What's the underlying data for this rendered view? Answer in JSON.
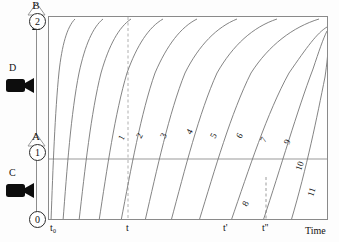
{
  "figure": {
    "type": "diagram"
  },
  "state_axis": {
    "name": "vertical-state-axis",
    "nodes": [
      {
        "id": "node-0",
        "label": "0",
        "y_frac": 0.98
      },
      {
        "id": "node-1",
        "label": "1",
        "y_frac": 0.66
      },
      {
        "id": "node-2",
        "label": "2",
        "y_frac": 0.035
      }
    ],
    "transitions": [
      {
        "id": "transition-A",
        "label": "A",
        "y_frac": 0.6
      },
      {
        "id": "transition-B",
        "label": "B",
        "y_frac": 0.0
      }
    ],
    "cameras": [
      {
        "id": "camera-C",
        "label": "C",
        "y_frac": 0.79
      },
      {
        "id": "camera-D",
        "label": "D",
        "y_frac": 0.36
      }
    ]
  },
  "plot": {
    "x_axis_title": "Time",
    "x_ticks": [
      {
        "label": "t₀",
        "x": 4
      },
      {
        "label": "t",
        "x": 80
      },
      {
        "label": "t'",
        "x": 178
      },
      {
        "label": "t''",
        "x": 218
      }
    ],
    "guides": {
      "horizontal_level_label": "1",
      "dashed_verticals": [
        {
          "at": "t",
          "x": 80,
          "full_height": true
        },
        {
          "at": "t''",
          "x": 219,
          "full_height": false
        }
      ]
    },
    "curve_labels": [
      "1",
      "2",
      "3",
      "4",
      "5",
      "6",
      "7",
      "8",
      "9",
      "10",
      "11"
    ]
  },
  "chart_data": {
    "type": "line",
    "title": "",
    "xlabel": "Time",
    "ylabel": "",
    "xlim": [
      0,
      280
    ],
    "ylim": [
      0,
      204
    ],
    "grid": false,
    "legend": "none",
    "annotations": [
      {
        "text": "t₀",
        "x": 4,
        "y": 204
      },
      {
        "text": "t",
        "x": 80,
        "y": 204
      },
      {
        "text": "t'",
        "x": 178,
        "y": 204
      },
      {
        "text": "t''",
        "x": 218,
        "y": 204
      },
      {
        "text": "Time",
        "x": 262,
        "y": 204
      }
    ],
    "series": [
      {
        "name": "1",
        "path": "M 2,204 C 4,150 6,95 10,55 C 13,28 18,10 26,2"
      },
      {
        "name": "2",
        "path": "M 14,204 C 18,152 22,96 30,56 C 36,28 44,10 54,2"
      },
      {
        "name": "3",
        "path": "M 30,204 C 36,152 42,96 52,56 C 60,28 70,10 82,2"
      },
      {
        "name": "4",
        "path": "M 50,204 C 58,152 66,96 78,56 C 88,28 100,10 114,2"
      },
      {
        "name": "5",
        "path": "M 72,204 C 82,152 92,96 106,56 C 118,28 132,10 148,2"
      },
      {
        "name": "6",
        "path": "M 96,204 C 108,152 120,96 136,56 C 150,28 168,10 188,2"
      },
      {
        "name": "7",
        "path": "M 122,204 C 136,152 150,96 168,56 C 184,28 204,10 228,2"
      },
      {
        "name": "8",
        "path": "M 150,204 C 166,152 182,96 202,56 C 220,28 244,10 270,2"
      },
      {
        "name": "9",
        "path": "M 182,204 C 200,152 218,96 240,56 C 258,30 268,16 278,10"
      },
      {
        "name": "10",
        "path": "M 214,204 C 232,150 248,94 264,52 C 270,34 274,22 278,14"
      },
      {
        "name": "11",
        "path": "M 242,204 C 258,150 268,100 276,60 C 278,46 279,36 279,30"
      }
    ],
    "curve_number_positions": [
      {
        "label": "1",
        "x": 74,
        "y": 124,
        "rot": -62
      },
      {
        "label": "2",
        "x": 92,
        "y": 122,
        "rot": -62
      },
      {
        "label": "3",
        "x": 116,
        "y": 122,
        "rot": -62
      },
      {
        "label": "4",
        "x": 142,
        "y": 118,
        "rot": -62
      },
      {
        "label": "5",
        "x": 166,
        "y": 122,
        "rot": -62
      },
      {
        "label": "6",
        "x": 192,
        "y": 122,
        "rot": -62
      },
      {
        "label": "7",
        "x": 216,
        "y": 126,
        "rot": -62
      },
      {
        "label": "8",
        "x": 198,
        "y": 190,
        "rot": -62
      },
      {
        "label": "9",
        "x": 240,
        "y": 128,
        "rot": -68
      },
      {
        "label": "10",
        "x": 252,
        "y": 154,
        "rot": -72
      },
      {
        "label": "11",
        "x": 264,
        "y": 180,
        "rot": -72
      }
    ]
  }
}
